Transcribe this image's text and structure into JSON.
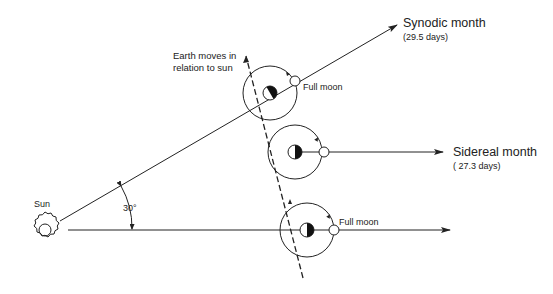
{
  "labels": {
    "sun": "Sun",
    "angle": "30°",
    "earth_motion_line1": "Earth moves in",
    "earth_motion_line2": "relation to sun",
    "synodic_title": "Synodic month",
    "synodic_days": "(29.5 days)",
    "sidereal_title": "Sidereal month",
    "sidereal_days": "( 27.3 days)",
    "full_moon_top": "Full moon",
    "full_moon_bottom": "Full moon"
  },
  "diagram": {
    "sun": {
      "cx": 45,
      "cy": 230
    },
    "earth_positions": [
      {
        "name": "synodic-position",
        "cx": 270,
        "cy": 93,
        "moon_cx": 295,
        "moon_cy": 79
      },
      {
        "name": "sidereal-position",
        "cx": 295,
        "cy": 152,
        "moon_cx": 322,
        "moon_cy": 152
      },
      {
        "name": "start-position",
        "cx": 308,
        "cy": 230,
        "moon_cx": 334,
        "moon_cy": 230
      }
    ],
    "angle_degrees": 30,
    "line_color": "#222222"
  }
}
